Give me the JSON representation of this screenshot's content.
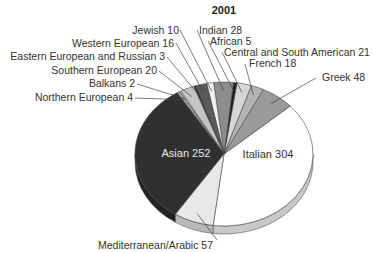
{
  "chart_data": {
    "type": "pie",
    "title": "2001",
    "style": "3d-pie",
    "total": 788,
    "slices": [
      {
        "label": "Italian",
        "value": 304,
        "color": "#ffffff",
        "side": "#c8c8c8",
        "label_pos": "inside",
        "lx": 268,
        "ly": 158,
        "text_color": "#333333"
      },
      {
        "label": "Greek",
        "value": 48,
        "color": "#9a9a9a",
        "side": "#7a7a7a",
        "label_pos": "outside",
        "lx": 322,
        "ly": 81,
        "anchor": "start",
        "tx": 316,
        "ty": 78
      },
      {
        "label": "French",
        "value": 18,
        "color": "#b4b4b4",
        "side": "#909090",
        "label_pos": "outside",
        "lx": 249,
        "ly": 67,
        "anchor": "start",
        "tx": 245,
        "ty": 64
      },
      {
        "label": "Central and South American",
        "value": 21,
        "color": "#d6d6d6",
        "side": "#b0b0b0",
        "label_pos": "outside",
        "lx": 224,
        "ly": 56,
        "anchor": "start",
        "tx": 222,
        "ty": 52
      },
      {
        "label": "African",
        "value": 5,
        "color": "#1e1e1e",
        "side": "#111111",
        "label_pos": "outside",
        "lx": 210,
        "ly": 45,
        "anchor": "start",
        "tx": 208,
        "ty": 41
      },
      {
        "label": "Indian",
        "value": 28,
        "color": "#8c8c8c",
        "side": "#6e6e6e",
        "label_pos": "outside",
        "lx": 199,
        "ly": 34,
        "anchor": "start",
        "tx": 197,
        "ty": 30
      },
      {
        "label": "Jewish",
        "value": 10,
        "color": "#f2f2f2",
        "side": "#cfcfcf",
        "label_pos": "outside",
        "lx": 179,
        "ly": 34,
        "anchor": "end",
        "tx": 180,
        "ty": 30
      },
      {
        "label": "Western European",
        "value": 16,
        "color": "#5a5a5a",
        "side": "#444444",
        "label_pos": "outside",
        "lx": 174,
        "ly": 47,
        "anchor": "end",
        "tx": 176,
        "ty": 43
      },
      {
        "label": "Eastern European and Russian",
        "value": 3,
        "color": "#2e2e2e",
        "side": "#1c1c1c",
        "label_pos": "outside",
        "lx": 165,
        "ly": 60,
        "anchor": "end",
        "tx": 167,
        "ty": 57
      },
      {
        "label": "Southern European",
        "value": 20,
        "color": "#c4c4c4",
        "side": "#a0a0a0",
        "label_pos": "outside",
        "lx": 157,
        "ly": 74,
        "anchor": "end",
        "tx": 159,
        "ty": 71
      },
      {
        "label": "Balkans",
        "value": 2,
        "color": "#e6e6e6",
        "side": "#c0c0c0",
        "label_pos": "outside",
        "lx": 135,
        "ly": 87,
        "anchor": "end",
        "tx": 137,
        "ty": 84
      },
      {
        "label": "Northern European",
        "value": 4,
        "color": "#a8a8a8",
        "side": "#888888",
        "label_pos": "outside",
        "lx": 133,
        "ly": 101,
        "anchor": "end",
        "tx": 135,
        "ty": 98
      },
      {
        "label": "Asian",
        "value": 252,
        "color": "#303030",
        "side": "#222222",
        "label_pos": "inside",
        "lx": 186,
        "ly": 157,
        "text_color": "#e8e8e8"
      },
      {
        "label": "Mediterranean/Arabic",
        "value": 57,
        "color": "#e8e8e8",
        "side": "#b8b8b8",
        "label_pos": "outside",
        "lx": 213,
        "ly": 249,
        "anchor": "end",
        "tx": 217,
        "ty": 240
      }
    ],
    "start_angle_deg": 97,
    "direction": "counterclockwise",
    "legend": "none",
    "grid": false
  }
}
